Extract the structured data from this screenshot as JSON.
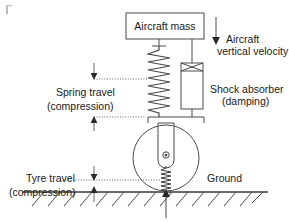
{
  "diagram": {
    "background_color": "#ffffff",
    "line_color": "#4a4a4a",
    "text_color": "#1a1a1a",
    "labels": {
      "aircraft_mass": "Aircraft mass",
      "aircraft_vertical_velocity_line1": "Aircraft",
      "aircraft_vertical_velocity_line2": "vertical velocity",
      "shock_absorber_line1": "Shock absorber",
      "shock_absorber_line2": "(damping)",
      "spring_travel_line1": "Spring travel",
      "spring_travel_line2": "(compression)",
      "tyre_travel_line1": "Tyre travel",
      "tyre_travel_line2": "(compression)",
      "ground": "Ground"
    },
    "components": [
      {
        "name": "aircraft-mass-block",
        "label": "Aircraft mass"
      },
      {
        "name": "main-spring",
        "label": "Spring (stiffness)"
      },
      {
        "name": "shock-absorber-damper",
        "label": "Shock absorber (damping)"
      },
      {
        "name": "wheel-assembly",
        "label": "Wheel"
      },
      {
        "name": "tyre-spring",
        "label": "Tyre"
      },
      {
        "name": "ground-surface",
        "label": "Ground"
      }
    ],
    "annotations": [
      {
        "name": "aircraft-vertical-velocity",
        "text": "Aircraft vertical velocity",
        "arrow": "down"
      },
      {
        "name": "spring-travel-dimension",
        "text": "Spring travel (compression)",
        "arrow": "double-vertical"
      },
      {
        "name": "tyre-travel-dimension",
        "text": "Tyre travel (compression)",
        "arrow": "double-vertical"
      },
      {
        "name": "ground-reaction-arrow",
        "text": "",
        "arrow": "up"
      }
    ]
  }
}
